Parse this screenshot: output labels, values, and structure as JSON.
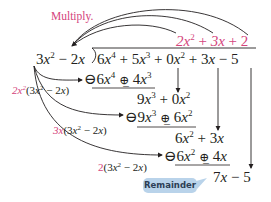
{
  "title_label": "Multiply.",
  "quotient": {
    "t1": "2x²",
    "t2": "3x",
    "t3": "2"
  },
  "divisor": "3x² − 2x",
  "dividend": "6x⁴ + 5x³ + 0x² + 3x − 5",
  "steps": [
    {
      "multiplier": "2x²",
      "factor": "(3x² − 2x)",
      "product": "6x⁴ ⊕ 4x³",
      "remainder": "9x³ + 0x²"
    },
    {
      "multiplier": "3x",
      "factor": "(3x² − 2x)",
      "product": "9x³ ⊕ 6x²",
      "remainder": "6x² + 3x"
    },
    {
      "multiplier": "2",
      "factor": "(3x² − 2x)",
      "product": "6x² ⊕ 4x",
      "remainder": "7x − 5"
    }
  ],
  "callout": "Remainder",
  "colors": {
    "accent": "#d4447c",
    "callout_bg": "#b9d3ea"
  }
}
